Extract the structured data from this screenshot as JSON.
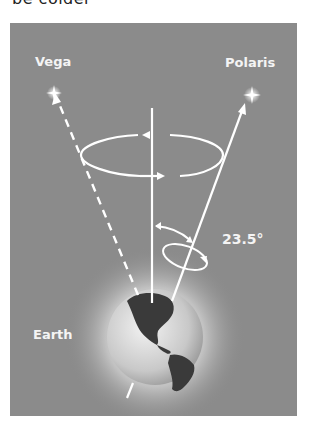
{
  "page": {
    "top_text": "be colder"
  },
  "figure": {
    "labels": {
      "vega": "Vega",
      "polaris": "Polaris",
      "angle": "23.5°",
      "earth": "Earth"
    },
    "colors": {
      "background": "#8b8b8b",
      "lines": "#ffffff",
      "label_text": "#f4f4f4"
    }
  }
}
